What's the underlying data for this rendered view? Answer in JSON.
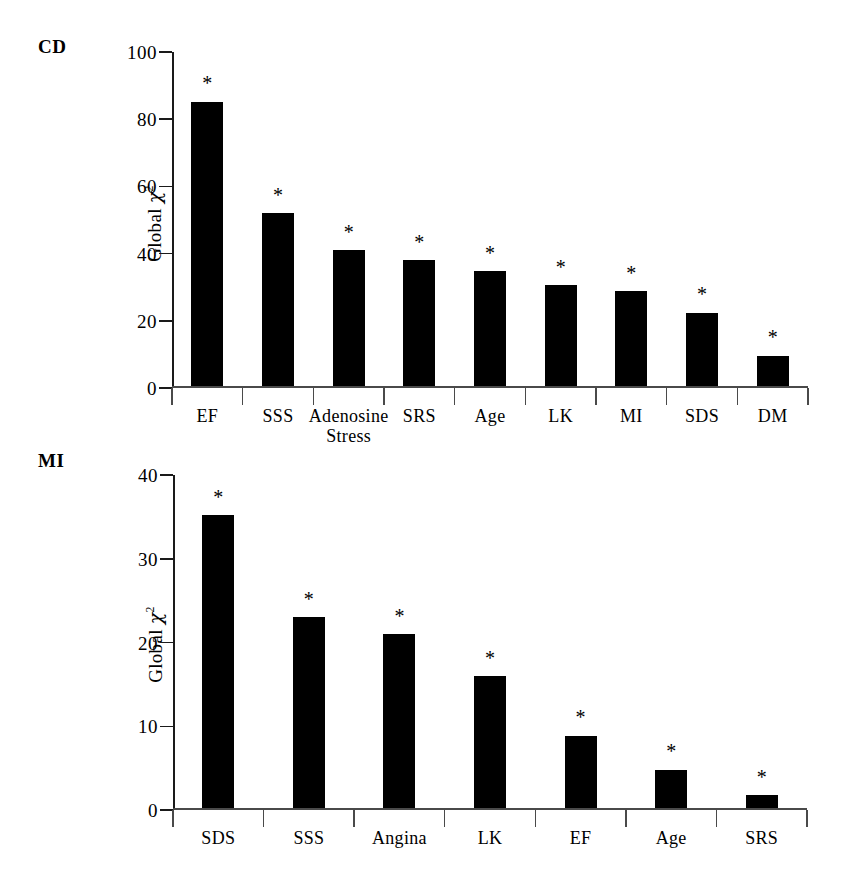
{
  "figure": {
    "background": "#ffffff",
    "bar_color": "#000000",
    "axis_color": "#1a1a1a",
    "significance_marker": "*"
  },
  "panels": [
    {
      "id": "cd",
      "label": "CD",
      "ylabel_prefix": "Global ",
      "ylabel_symbol": "χ",
      "ylabel_exponent": "2"
    },
    {
      "id": "mi",
      "label": "MI",
      "ylabel_prefix": "Global ",
      "ylabel_symbol": "χ",
      "ylabel_exponent": "2"
    }
  ],
  "chart_data": [
    {
      "type": "bar",
      "title": "CD",
      "xlabel": "",
      "ylabel": "Global χ²",
      "ylim": [
        0,
        100
      ],
      "yticks": [
        0,
        20,
        40,
        60,
        80,
        100
      ],
      "grid": false,
      "legend": "none",
      "categories": [
        "EF",
        "SSS",
        "Adenosine\nStress",
        "SRS",
        "Age",
        "LK",
        "MI",
        "SDS",
        "DM"
      ],
      "values": [
        84.7,
        51.6,
        40.6,
        37.5,
        34.3,
        30.2,
        28.3,
        21.9,
        9.2
      ],
      "annotations": [
        "*",
        "*",
        "*",
        "*",
        "*",
        "*",
        "*",
        "*",
        "*"
      ]
    },
    {
      "type": "bar",
      "title": "MI",
      "xlabel": "",
      "ylabel": "Global χ²",
      "ylim": [
        0,
        40
      ],
      "yticks": [
        0,
        10,
        20,
        30,
        40
      ],
      "grid": false,
      "legend": "none",
      "categories": [
        "SDS",
        "SSS",
        "Angina",
        "LK",
        "EF",
        "Age",
        "SRS"
      ],
      "values": [
        35.0,
        22.8,
        20.8,
        15.8,
        8.7,
        4.6,
        1.6
      ],
      "annotations": [
        "*",
        "*",
        "*",
        "*",
        "*",
        "*",
        "*"
      ]
    }
  ]
}
